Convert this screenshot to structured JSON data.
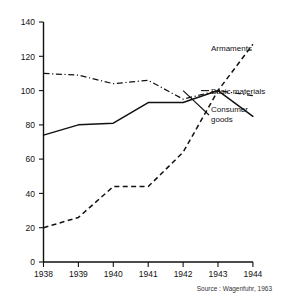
{
  "chart_data": {
    "type": "line",
    "title": "",
    "subtitle": "",
    "xlabel": "",
    "ylabel": "",
    "x": [
      1938,
      1939,
      1940,
      1941,
      1942,
      1943,
      1944
    ],
    "categories": [
      "1938",
      "1939",
      "1940",
      "1941",
      "1942",
      "1943",
      "1944"
    ],
    "xlim": [
      1938,
      1944
    ],
    "ylim": [
      0,
      140
    ],
    "yticks": [
      0,
      20,
      40,
      60,
      80,
      100,
      120,
      140
    ],
    "ytick_labels": [
      "0",
      "20",
      "40",
      "60",
      "80",
      "100",
      "120",
      "140"
    ],
    "grid": false,
    "legend_position": "right-inline-labels",
    "series": [
      {
        "name": "Armaments",
        "style": "dashed",
        "color": "#111111",
        "x": [
          1938,
          1939,
          1940,
          1941,
          1942,
          1943,
          1944
        ],
        "values": [
          20,
          26,
          44,
          44,
          64,
          100,
          127
        ]
      },
      {
        "name": "Basic materials",
        "style": "dash-dot",
        "color": "#111111",
        "x": [
          1938,
          1939,
          1940,
          1941,
          1942,
          1943,
          1944
        ],
        "values": [
          110,
          109,
          104,
          106,
          95,
          100,
          97
        ]
      },
      {
        "name": "Consumer goods",
        "style": "solid",
        "color": "#111111",
        "x": [
          1938,
          1939,
          1940,
          1941,
          1942,
          1943,
          1944
        ],
        "values": [
          74,
          80,
          81,
          93,
          93,
          100,
          85
        ]
      }
    ],
    "annotations": [
      {
        "name": "armaments-label",
        "text": "Armaments"
      },
      {
        "name": "basic-materials-label",
        "text": "Basic materials"
      },
      {
        "name": "consumer-goods-label-line1",
        "text": "Consumer"
      },
      {
        "name": "consumer-goods-label-line2",
        "text": "goods"
      }
    ],
    "source": "Source : Wagenfuhr, 1963"
  },
  "axis": {
    "y_labels": [
      "140",
      "120",
      "100",
      "80",
      "60",
      "40",
      "20",
      "0"
    ],
    "x_labels": [
      "1938",
      "1939",
      "1940",
      "1941",
      "1942",
      "1943",
      "1944"
    ]
  },
  "labels": {
    "armaments": "Armaments",
    "basic_materials": "Basic materials",
    "consumer_goods_1": "Consumer",
    "consumer_goods_2": "goods"
  },
  "footer": {
    "source": "Source : Wagenfuhr, 1963"
  }
}
